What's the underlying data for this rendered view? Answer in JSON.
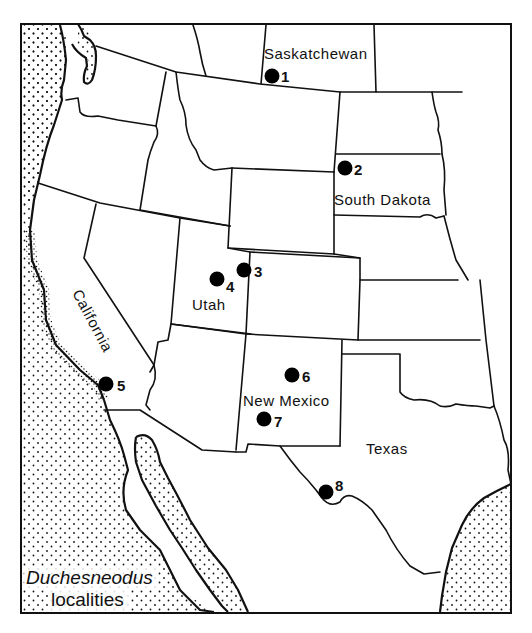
{
  "map": {
    "legend": {
      "title": "Duchesneodus",
      "subtitle": "localities"
    },
    "regions": [
      {
        "name": "Saskatchewan",
        "x": 270,
        "y": 58
      },
      {
        "name": "South Dakota",
        "x": 334,
        "y": 207
      },
      {
        "name": "Utah",
        "x": 192,
        "y": 310
      },
      {
        "name": "California",
        "x": 70,
        "y": 296,
        "rotate": 62
      },
      {
        "name": "New Mexico",
        "x": 244,
        "y": 406
      },
      {
        "name": "Texas",
        "x": 365,
        "y": 454
      }
    ],
    "localities": [
      {
        "id": "1",
        "cx": 272,
        "cy": 76,
        "lx": 282,
        "ly": 82
      },
      {
        "id": "2",
        "cx": 345,
        "cy": 168,
        "lx": 355,
        "ly": 174
      },
      {
        "id": "3",
        "cx": 243,
        "cy": 270,
        "lx": 255,
        "ly": 276
      },
      {
        "id": "4",
        "cx": 216,
        "cy": 279,
        "lx": 225,
        "ly": 291
      },
      {
        "id": "5",
        "cx": 105,
        "cy": 384,
        "lx": 118,
        "ly": 390
      },
      {
        "id": "6",
        "cx": 292,
        "cy": 375,
        "lx": 303,
        "ly": 382
      },
      {
        "id": "7",
        "cx": 263,
        "cy": 419,
        "lx": 275,
        "ly": 427
      },
      {
        "id": "8",
        "cx": 325,
        "cy": 492,
        "lx": 336,
        "ly": 492
      }
    ],
    "colors": {
      "ink": "#111111",
      "background": "#ffffff"
    }
  }
}
